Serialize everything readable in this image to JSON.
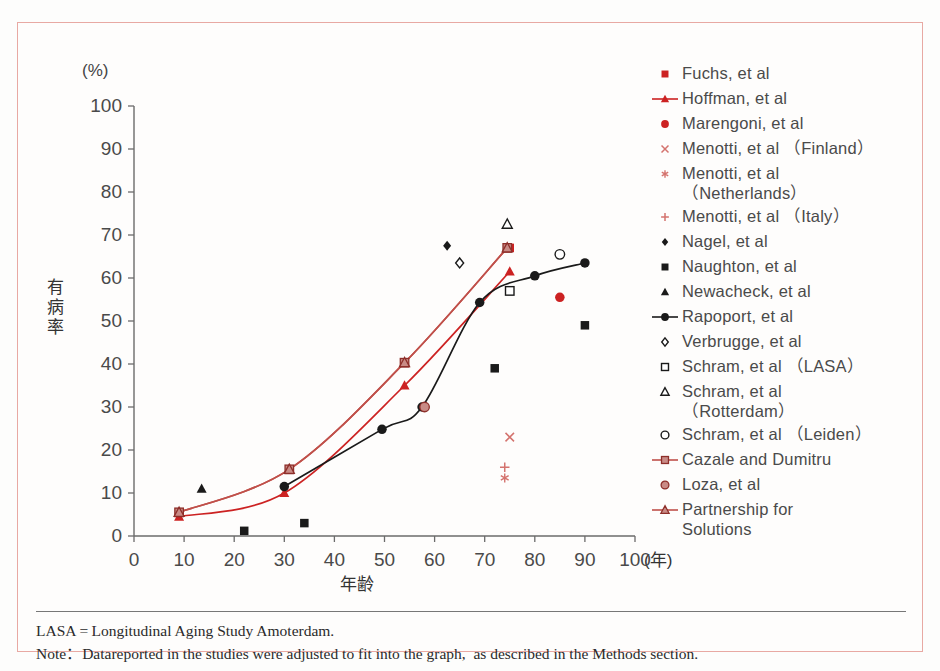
{
  "figure": {
    "y_axis_unit": "(%)",
    "y_axis_label": "有病率",
    "x_axis_label": "年齢",
    "x_axis_unit": "(年)",
    "border_color": "#e8a9a3",
    "accent_color": "#cc2222"
  },
  "footer": {
    "line1": "LASA = Longitudinal Aging Study Amoterdam.",
    "line2": "Note：Datareported in the studies were adjusted to fit into the graph,  as described in the Methods section."
  },
  "legend": {
    "items": [
      {
        "label": "Fuchs, et al",
        "marker": "square-filled",
        "color": "#cc2222",
        "line": false
      },
      {
        "label": "Hoffman, et al",
        "marker": "triangle-filled",
        "color": "#cc2222",
        "line": true
      },
      {
        "label": "Marengoni, et al",
        "marker": "circle-filled",
        "color": "#cc2222",
        "line": false
      },
      {
        "label": "Menotti, et al （Finland）",
        "marker": "cross-x",
        "color": "#d4736e",
        "line": false
      },
      {
        "label": "Menotti, et al\n（Netherlands）",
        "marker": "asterisk",
        "color": "#d4736e",
        "line": false
      },
      {
        "label": "Menotti, et al （Italy）",
        "marker": "plus",
        "color": "#d4736e",
        "line": false
      },
      {
        "label": "Nagel, et al",
        "marker": "diamond-filled",
        "color": "#1a1a1a",
        "line": false
      },
      {
        "label": "Naughton, et al",
        "marker": "square-filled",
        "color": "#1a1a1a",
        "line": false
      },
      {
        "label": "Newacheck, et al",
        "marker": "triangle-filled",
        "color": "#1a1a1a",
        "line": false
      },
      {
        "label": "Rapoport, et al",
        "marker": "circle-filled",
        "color": "#1a1a1a",
        "line": true
      },
      {
        "label": "Verbrugge, et al",
        "marker": "diamond-open",
        "color": "#1a1a1a",
        "line": false
      },
      {
        "label": "Schram, et al （LASA）",
        "marker": "square-open",
        "color": "#1a1a1a",
        "line": false
      },
      {
        "label": "Schram, et al\n（Rotterdam）",
        "marker": "triangle-open",
        "color": "#1a1a1a",
        "line": false
      },
      {
        "label": "Schram, et al （Leiden）",
        "marker": "circle-open",
        "color": "#1a1a1a",
        "line": false
      },
      {
        "label": "Cazale and Dumitru",
        "marker": "square-half",
        "color": "#b5534e",
        "line": true
      },
      {
        "label": "Loza, et al",
        "marker": "circle-half",
        "color": "#b5534e",
        "line": false
      },
      {
        "label": "Partnership for\nSolutions",
        "marker": "triangle-half",
        "color": "#b5534e",
        "line": true
      }
    ]
  },
  "chart_data": {
    "type": "scatter",
    "title": "",
    "xlabel": "年齢",
    "ylabel": "有病率",
    "xunit": "(年)",
    "yunit": "(%)",
    "xlim": [
      0,
      100
    ],
    "ylim": [
      0,
      100
    ],
    "xticks": [
      0,
      10,
      20,
      30,
      40,
      50,
      60,
      70,
      80,
      90,
      100
    ],
    "yticks": [
      0,
      10,
      20,
      30,
      40,
      50,
      60,
      70,
      80,
      90,
      100
    ],
    "grid": false,
    "legend_position": "right",
    "series": [
      {
        "name": "Fuchs, et al",
        "marker": "square-filled",
        "color": "#cc2222",
        "line": false,
        "points": [
          [
            75,
            67
          ]
        ]
      },
      {
        "name": "Hoffman, et al",
        "marker": "triangle-filled",
        "color": "#cc2222",
        "line": true,
        "points": [
          [
            9,
            4.5
          ],
          [
            30,
            10
          ],
          [
            54,
            35
          ],
          [
            75,
            61.5
          ]
        ]
      },
      {
        "name": "Marengoni, et al",
        "marker": "circle-filled",
        "color": "#cc2222",
        "line": false,
        "points": [
          [
            85,
            55.5
          ]
        ]
      },
      {
        "name": "Menotti, et al (Finland)",
        "marker": "cross-x",
        "color": "#d4736e",
        "line": false,
        "points": [
          [
            75,
            23
          ]
        ]
      },
      {
        "name": "Menotti, et al (Netherlands)",
        "marker": "asterisk",
        "color": "#d4736e",
        "line": false,
        "points": [
          [
            74,
            13.5
          ]
        ]
      },
      {
        "name": "Menotti, et al (Italy)",
        "marker": "plus",
        "color": "#d4736e",
        "line": false,
        "points": [
          [
            74,
            16
          ]
        ]
      },
      {
        "name": "Nagel, et al",
        "marker": "diamond-filled",
        "color": "#1a1a1a",
        "line": false,
        "points": [
          [
            62.5,
            67.5
          ]
        ]
      },
      {
        "name": "Naughton, et al",
        "marker": "square-filled",
        "color": "#1a1a1a",
        "line": false,
        "points": [
          [
            22,
            1.2
          ],
          [
            34,
            3
          ],
          [
            72,
            39
          ],
          [
            90,
            49
          ]
        ]
      },
      {
        "name": "Newacheck, et al",
        "marker": "triangle-filled",
        "color": "#1a1a1a",
        "line": false,
        "points": [
          [
            13.5,
            11
          ]
        ]
      },
      {
        "name": "Rapoport, et al",
        "marker": "circle-filled",
        "color": "#1a1a1a",
        "line": true,
        "points": [
          [
            30,
            11.5
          ],
          [
            49.5,
            24.8
          ],
          [
            57.5,
            30
          ],
          [
            69,
            54.3
          ],
          [
            80,
            60.5
          ],
          [
            90,
            63.5
          ]
        ]
      },
      {
        "name": "Verbrugge, et al",
        "marker": "diamond-open",
        "color": "#1a1a1a",
        "line": false,
        "points": [
          [
            65,
            63.5
          ]
        ]
      },
      {
        "name": "Schram, et al (LASA)",
        "marker": "square-open",
        "color": "#1a1a1a",
        "line": false,
        "points": [
          [
            75,
            57
          ]
        ]
      },
      {
        "name": "Schram, et al (Rotterdam)",
        "marker": "triangle-open",
        "color": "#1a1a1a",
        "line": false,
        "points": [
          [
            74.5,
            72.5
          ]
        ]
      },
      {
        "name": "Schram, et al (Leiden)",
        "marker": "circle-open",
        "color": "#1a1a1a",
        "line": false,
        "points": [
          [
            85,
            65.5
          ]
        ]
      },
      {
        "name": "Cazale and Dumitru",
        "marker": "square-half",
        "color": "#b5534e",
        "line": true,
        "points": [
          [
            9,
            5.5
          ],
          [
            31,
            15.5
          ],
          [
            54,
            40.3
          ],
          [
            74.5,
            67
          ]
        ]
      },
      {
        "name": "Loza, et al",
        "marker": "circle-half",
        "color": "#b5534e",
        "line": false,
        "points": [
          [
            58,
            30
          ]
        ]
      },
      {
        "name": "Partnership for Solutions",
        "marker": "triangle-half",
        "color": "#b5534e",
        "line": true,
        "points": [
          [
            9,
            5.5
          ],
          [
            31,
            15.5
          ],
          [
            54,
            40.3
          ],
          [
            74.5,
            67
          ]
        ]
      }
    ]
  }
}
